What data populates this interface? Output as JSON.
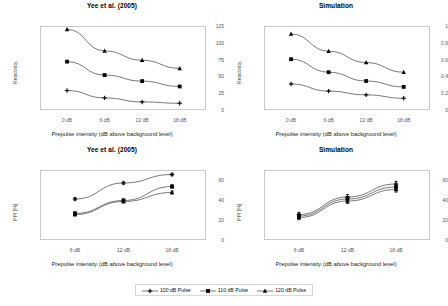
{
  "figure": {
    "width": 448,
    "height": 306,
    "background": "#ffffff",
    "axis_color": "#c9c9c9",
    "line_color": "#555555",
    "marker_color": "#000000"
  },
  "legend": {
    "position": "bottom-center",
    "items": [
      {
        "label": "100 dB Pulse",
        "marker": "cross"
      },
      {
        "label": "110 dB Pulse",
        "marker": "square"
      },
      {
        "label": "120 dB Pulse",
        "marker": "triangle"
      }
    ]
  },
  "chart_data": [
    {
      "id": "top-left",
      "type": "line",
      "title": "Yee et al. (2005)",
      "xlabel": "Prepulse intensity (dB above background level)",
      "ylabel": "Reactivity",
      "categories": [
        "0 dB",
        "6 dB",
        "12 dB",
        "18 dB"
      ],
      "yticks": [
        0,
        25,
        50,
        75,
        100,
        125
      ],
      "ylim": [
        0,
        125
      ],
      "grid": false,
      "series": [
        {
          "name": "100 dB Pulse",
          "marker": "cross",
          "values": [
            29,
            18,
            12,
            10
          ]
        },
        {
          "name": "110 dB Pulse",
          "marker": "square",
          "values": [
            72,
            52,
            43,
            35
          ]
        },
        {
          "name": "120 dB Pulse",
          "marker": "triangle",
          "values": [
            120,
            88,
            74,
            62
          ]
        }
      ]
    },
    {
      "id": "top-right",
      "type": "line",
      "title": "Simulation",
      "xlabel": "Prepulse intensity (dB above background level)",
      "ylabel": "Reactivity",
      "categories": [
        "0 dB",
        "6 dB",
        "12 dB",
        "18 dB"
      ],
      "yticks": [
        0,
        0.2,
        0.4,
        0.6,
        0.8,
        1
      ],
      "ylim": [
        0,
        1
      ],
      "grid": false,
      "series": [
        {
          "name": "100 dB Pulse",
          "marker": "cross",
          "values": [
            0.31,
            0.225,
            0.18,
            0.14
          ]
        },
        {
          "name": "110 dB Pulse",
          "marker": "square",
          "values": [
            0.605,
            0.45,
            0.345,
            0.275
          ]
        },
        {
          "name": "120 dB Pulse",
          "marker": "triangle",
          "values": [
            0.905,
            0.7,
            0.565,
            0.45
          ]
        }
      ]
    },
    {
      "id": "bottom-left",
      "type": "line",
      "title": "Yee et al. (2005)",
      "xlabel": "Prepulse intensity (dB above background level)",
      "ylabel": "PPI [%]",
      "categories": [
        "6 dB",
        "12 dB",
        "18 dB"
      ],
      "yticks": [
        0,
        20,
        40,
        60
      ],
      "ylim": [
        0,
        70
      ],
      "grid": false,
      "series": [
        {
          "name": "100 dB Pulse",
          "marker": "cross",
          "values": [
            41,
            57,
            65.5
          ],
          "errors": [
            1.2,
            1.2,
            1.2
          ]
        },
        {
          "name": "110 dB Pulse",
          "marker": "square",
          "values": [
            26.5,
            39.5,
            53.5
          ],
          "errors": [
            1.6,
            1.6,
            1.6
          ]
        },
        {
          "name": "120 dB Pulse",
          "marker": "triangle",
          "values": [
            25.5,
            38.5,
            47.5
          ],
          "errors": [
            1.4,
            1.4,
            1.4
          ]
        }
      ]
    },
    {
      "id": "bottom-right",
      "type": "line",
      "title": "Simulation",
      "xlabel": "Prepulse intensity (dB above background level)",
      "ylabel": "PPI [%]",
      "categories": [
        "6 dB",
        "12 dB",
        "18 dB"
      ],
      "yticks": [
        0,
        20,
        40,
        60
      ],
      "ylim": [
        0,
        70
      ],
      "grid": false,
      "series": [
        {
          "name": "100 dB Pulse",
          "marker": "cross",
          "values": [
            25.5,
            43,
            56
          ],
          "errors": [
            2.2,
            2.4,
            2.6
          ]
        },
        {
          "name": "110 dB Pulse",
          "marker": "square",
          "values": [
            24,
            41,
            53
          ],
          "errors": [
            2.2,
            2.4,
            2.6
          ]
        },
        {
          "name": "120 dB Pulse",
          "marker": "triangle",
          "values": [
            22.5,
            39,
            50.5
          ],
          "errors": [
            2.2,
            2.4,
            2.6
          ]
        }
      ]
    }
  ]
}
